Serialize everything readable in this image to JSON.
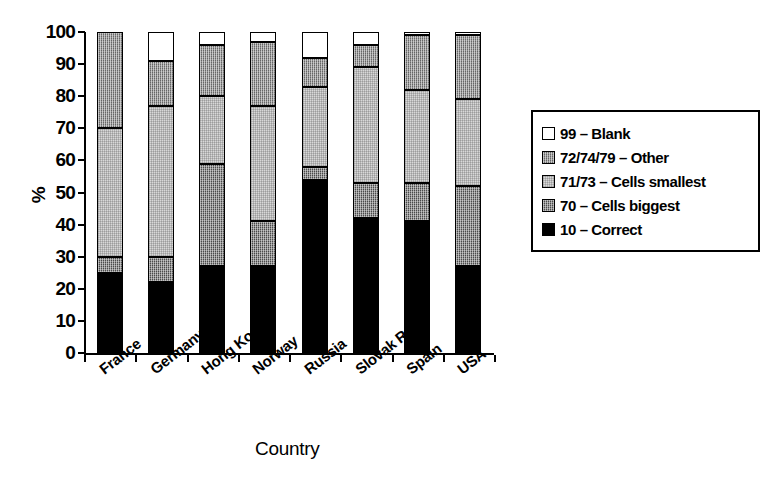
{
  "chart_data": {
    "type": "bar",
    "stacked": true,
    "title": "",
    "xlabel": "Country",
    "ylabel": "%",
    "ylim": [
      0,
      100
    ],
    "yticks": [
      0,
      10,
      20,
      30,
      40,
      50,
      60,
      70,
      80,
      90,
      100
    ],
    "grid": false,
    "legend_position": "right",
    "categories": [
      "France",
      "Germany",
      "Hong Kong",
      "Norway",
      "Russia",
      "Slovak Rep.",
      "Spain",
      "USA"
    ],
    "series": [
      {
        "name": "10 – Correct",
        "key": "correct",
        "color": "#000000",
        "fill": "fill-black",
        "values": [
          25,
          22,
          27,
          27,
          54,
          42,
          41,
          27
        ]
      },
      {
        "name": "70 – Cells biggest",
        "key": "cells_biggest",
        "color": "#4a4a4a",
        "fill": "fill-darkgray",
        "values": [
          5,
          8,
          32,
          14,
          4,
          11,
          12,
          25
        ]
      },
      {
        "name": "71/73 – Cells smallest",
        "key": "cells_smallest",
        "color": "#d8d8d8",
        "fill": "fill-lightgray",
        "values": [
          40,
          47,
          21,
          36,
          25,
          36,
          29,
          27
        ]
      },
      {
        "name": "72/74/79 – Other",
        "key": "other",
        "color": "#8d8d8d",
        "fill": "fill-midgray",
        "values": [
          30,
          14,
          16,
          20,
          9,
          7,
          17,
          20
        ]
      },
      {
        "name": "99 – Blank",
        "key": "blank",
        "color": "#ffffff",
        "fill": "fill-white",
        "values": [
          0,
          9,
          4,
          3,
          8,
          4,
          1,
          1
        ]
      }
    ]
  },
  "legend": {
    "items": [
      {
        "label": "99 – Blank",
        "fill": "fill-white"
      },
      {
        "label": "72/74/79 – Other",
        "fill": "fill-midgray"
      },
      {
        "label": "71/73 – Cells smallest",
        "fill": "fill-lightgray"
      },
      {
        "label": "70 – Cells biggest",
        "fill": "fill-darkgray"
      },
      {
        "label": "10 – Correct",
        "fill": "fill-black"
      }
    ]
  },
  "axes": {
    "y_title": "%",
    "x_title": "Country"
  }
}
